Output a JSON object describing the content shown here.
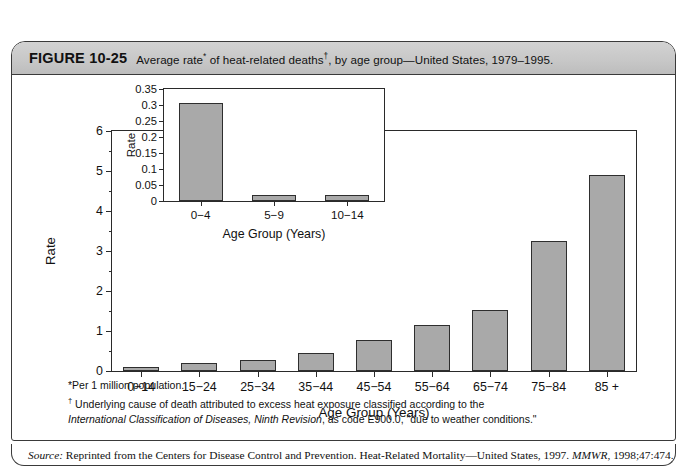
{
  "figure": {
    "number": "FIGURE 10-25",
    "caption_part1": "Average rate",
    "caption_sup1": "*",
    "caption_part2": " of heat-related deaths",
    "caption_sup2": "†",
    "caption_part3": ", by age group—United States, 1979–1995."
  },
  "footnotes": {
    "line1": "*Per 1 million population.",
    "line2_marker": "†",
    "line2": " Underlying cause of death attributed to excess heat exposure classified according to the",
    "line3_italic": "International Classification of Diseases, Ninth Revision",
    "line3_rest": ", as code E900.0, \"due to weather conditions.\""
  },
  "source": {
    "label": "Source:",
    "text_before": " Reprinted from the Centers for Disease Control and Prevention. Heat-Related Mortality—United States, 1997. ",
    "journal": "MMWR",
    "text_after": ", 1998;47:474."
  },
  "chart_data": [
    {
      "id": "main",
      "type": "bar",
      "title": "",
      "xlabel": "Age Group (Years)",
      "ylabel": "Rate",
      "categories": [
        "0−14",
        "15−24",
        "25−34",
        "35−44",
        "45−54",
        "55−64",
        "65−74",
        "75−84",
        "85 +"
      ],
      "values": [
        0.1,
        0.2,
        0.27,
        0.45,
        0.77,
        1.15,
        1.53,
        3.25,
        4.9
      ],
      "ylim": [
        0,
        6
      ],
      "ytick_labels": [
        "0",
        "1",
        "2",
        "3",
        "4",
        "5",
        "6"
      ],
      "ytick_values": [
        0,
        1,
        2,
        3,
        4,
        5,
        6
      ],
      "yminor_values": [
        0.5,
        1.5,
        2.5,
        3.5,
        4.5,
        5.5
      ],
      "grid": false,
      "legend": "none"
    },
    {
      "id": "inset",
      "type": "bar",
      "title": "",
      "xlabel": "Age Group (Years)",
      "ylabel": "Rate",
      "categories": [
        "0−4",
        "5−9",
        "10−14"
      ],
      "values": [
        0.305,
        0.02,
        0.02
      ],
      "ylim": [
        0,
        0.35
      ],
      "ytick_labels": [
        "0",
        "0.05",
        "0.1",
        "0.15",
        "0.2",
        "0.25",
        "0.3",
        "0.35"
      ],
      "ytick_values": [
        0,
        0.05,
        0.1,
        0.15,
        0.2,
        0.25,
        0.3,
        0.35
      ],
      "grid": false,
      "legend": "none"
    }
  ],
  "colors": {
    "bar_fill": "#a9a9a9",
    "bar_stroke": "#2e2e2e",
    "axis": "#2a2a2a",
    "header_band": "#c8c8c8",
    "frame": "#3a3a3a"
  }
}
